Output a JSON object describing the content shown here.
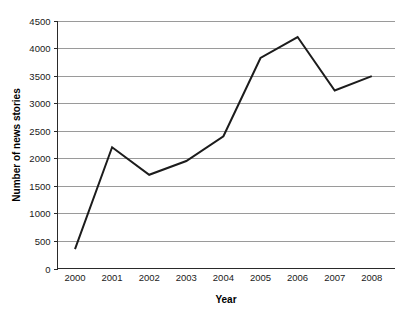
{
  "chart_data": {
    "type": "line",
    "title": "",
    "subtitle": "",
    "xlabel": "Year",
    "ylabel": "Number of news stories",
    "categories": [
      "2000",
      "2001",
      "2002",
      "2003",
      "2004",
      "2005",
      "2006",
      "2007",
      "2008"
    ],
    "x": [
      2000,
      2001,
      2002,
      2003,
      2004,
      2005,
      2006,
      2007,
      2008
    ],
    "values": [
      350,
      2200,
      1700,
      1950,
      2400,
      3820,
      4200,
      3230,
      3490
    ],
    "series": [
      {
        "name": "Number of news stories",
        "values": [
          350,
          2200,
          1700,
          1950,
          2400,
          3820,
          4200,
          3230,
          3490
        ]
      }
    ],
    "xlim": [
      2000,
      2008
    ],
    "ylim": [
      0,
      4500
    ],
    "y_ticks": [
      0,
      500,
      1000,
      1500,
      2000,
      2500,
      3000,
      3500,
      4000,
      4500
    ],
    "y_tick_labels": [
      "0",
      "500",
      "1000",
      "1500",
      "2000",
      "2500",
      "3000",
      "3500",
      "4000",
      "4500"
    ],
    "x_tick_labels": [
      "2000",
      "2001",
      "2002",
      "2003",
      "2004",
      "2005",
      "2006",
      "2007",
      "2008"
    ],
    "grid": "horizontal",
    "legend": "none",
    "legend_position": "none",
    "annotations": [],
    "colors": {
      "line": "#1c1c1c",
      "grid": "#9a9a9a",
      "axis": "#2a2a2a",
      "background": "#ffffff",
      "text": "#000000"
    }
  }
}
